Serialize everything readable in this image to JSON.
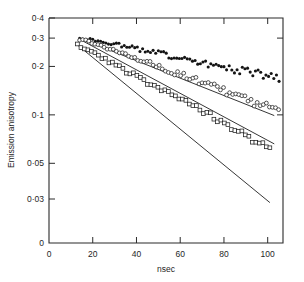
{
  "chart_data": {
    "type": "scatter",
    "title": "",
    "xlabel": "nsec",
    "ylabel": "Emission anisotropy",
    "yscale": "log",
    "xscale": "linear",
    "xlim": [
      0,
      107
    ],
    "ylim": [
      0.025,
      0.4
    ],
    "grid": false,
    "legend": "none",
    "xticks": [
      0,
      20,
      40,
      60,
      80,
      100
    ],
    "xtick_labels": [
      "0",
      "20",
      "40",
      "60",
      "80",
      "100"
    ],
    "yticks": [
      0.4,
      0.3,
      0.2,
      0.1,
      0.05,
      0.03
    ],
    "ytick_labels": [
      "0·4",
      "0·3",
      "0·2",
      "0·1",
      "0·05",
      "0·03"
    ],
    "y_origin_label": "0",
    "series": [
      {
        "name": "filled-circles",
        "marker": "filled-circle",
        "color": "#141414",
        "fit_line": {
          "x0": 14.0,
          "y0": 0.3,
          "x1": 103.0,
          "y1": 0.099
        },
        "x": [
          14.0,
          15.2,
          16.4,
          17.6,
          18.8,
          20.0,
          21.2,
          22.4,
          23.6,
          24.8,
          26.0,
          27.2,
          28.4,
          29.6,
          30.8,
          32.0,
          33.2,
          34.4,
          35.6,
          36.8,
          38.0,
          39.2,
          40.4,
          41.6,
          42.8,
          44.0,
          45.2,
          46.4,
          47.6,
          48.8,
          50.0,
          51.2,
          52.4,
          53.6,
          54.8,
          56.0,
          57.2,
          58.4,
          59.6,
          60.8,
          62.0,
          63.2,
          64.4,
          65.6,
          66.8,
          68.0,
          69.2,
          70.4,
          71.6,
          72.8,
          74.0,
          75.2,
          76.4,
          77.6,
          78.8,
          80.0,
          81.2,
          82.4,
          83.6,
          84.8,
          86.0,
          87.2,
          88.4,
          89.6,
          90.8,
          92.0,
          93.2,
          94.4,
          95.6,
          96.8,
          98.0,
          99.2,
          100.4,
          101.6,
          102.8,
          104.0,
          105.2
        ],
        "y": [
          0.301,
          0.299,
          0.297,
          0.296,
          0.293,
          0.291,
          0.289,
          0.288,
          0.285,
          0.283,
          0.281,
          0.279,
          0.277,
          0.276,
          0.273,
          0.271,
          0.269,
          0.267,
          0.265,
          0.263,
          0.261,
          0.259,
          0.257,
          0.255,
          0.253,
          0.251,
          0.249,
          0.248,
          0.246,
          0.244,
          0.242,
          0.24,
          0.238,
          0.236,
          0.234,
          0.233,
          0.231,
          0.229,
          0.227,
          0.226,
          0.224,
          0.222,
          0.22,
          0.219,
          0.217,
          0.215,
          0.213,
          0.212,
          0.21,
          0.208,
          0.207,
          0.205,
          0.203,
          0.202,
          0.2,
          0.198,
          0.197,
          0.195,
          0.194,
          0.192,
          0.191,
          0.189,
          0.188,
          0.186,
          0.185,
          0.183,
          0.182,
          0.18,
          0.179,
          0.177,
          0.176,
          0.174,
          0.173,
          0.172,
          0.17,
          0.169,
          0.167
        ]
      },
      {
        "name": "open-circles",
        "marker": "open-circle",
        "color": "#1f1f1f",
        "fit_line": {
          "x0": 14.0,
          "y0": 0.295,
          "x1": 103.0,
          "y1": 0.066
        },
        "x": [
          14.0,
          15.4,
          16.8,
          18.2,
          19.6,
          21.0,
          22.4,
          23.8,
          25.2,
          26.6,
          28.0,
          29.4,
          30.8,
          32.2,
          33.6,
          35.0,
          36.4,
          37.8,
          39.2,
          40.6,
          42.0,
          43.4,
          44.8,
          46.2,
          47.6,
          49.0,
          50.4,
          51.8,
          53.2,
          54.6,
          56.0,
          57.4,
          58.8,
          60.2,
          61.6,
          63.0,
          64.4,
          65.8,
          67.2,
          68.6,
          70.0,
          71.4,
          72.8,
          74.2,
          75.6,
          77.0,
          78.4,
          79.8,
          81.2,
          82.6,
          84.0,
          85.4,
          86.8,
          88.2,
          89.6,
          91.0,
          92.4,
          93.8,
          95.2,
          96.6,
          98.0,
          99.4,
          100.8,
          102.2,
          103.6,
          105.0
        ],
        "y": [
          0.296,
          0.292,
          0.288,
          0.284,
          0.279,
          0.275,
          0.271,
          0.267,
          0.263,
          0.259,
          0.255,
          0.251,
          0.247,
          0.243,
          0.24,
          0.236,
          0.232,
          0.229,
          0.225,
          0.222,
          0.218,
          0.215,
          0.211,
          0.208,
          0.205,
          0.202,
          0.198,
          0.195,
          0.192,
          0.189,
          0.186,
          0.183,
          0.18,
          0.177,
          0.175,
          0.172,
          0.169,
          0.166,
          0.164,
          0.161,
          0.158,
          0.156,
          0.153,
          0.151,
          0.148,
          0.146,
          0.144,
          0.141,
          0.139,
          0.137,
          0.135,
          0.132,
          0.13,
          0.128,
          0.126,
          0.124,
          0.122,
          0.12,
          0.118,
          0.117,
          0.115,
          0.113,
          0.111,
          0.109,
          0.108,
          0.106
        ]
      },
      {
        "name": "open-squares",
        "marker": "open-square",
        "color": "#1f1f1f",
        "fit_line": {
          "x0": 13.0,
          "y0": 0.272,
          "x1": 101.0,
          "y1": 0.0285
        },
        "x": [
          13.0,
          14.6,
          16.2,
          17.8,
          19.4,
          21.0,
          22.6,
          24.2,
          25.8,
          27.4,
          29.0,
          30.6,
          32.2,
          33.8,
          35.4,
          37.0,
          38.6,
          40.2,
          41.8,
          43.4,
          45.0,
          46.6,
          48.2,
          49.8,
          51.4,
          53.0,
          54.6,
          56.2,
          57.8,
          59.4,
          61.0,
          62.6,
          64.2,
          65.8,
          67.4,
          69.0,
          70.6,
          72.2,
          73.8,
          75.4,
          77.0,
          78.6,
          80.2,
          81.8,
          83.4,
          85.0,
          86.6,
          88.2,
          89.8,
          91.4,
          93.0,
          94.6,
          96.2,
          97.8,
          99.4,
          101.0
        ],
        "y": [
          0.273,
          0.266,
          0.259,
          0.252,
          0.245,
          0.239,
          0.232,
          0.226,
          0.22,
          0.214,
          0.209,
          0.203,
          0.198,
          0.192,
          0.187,
          0.182,
          0.177,
          0.173,
          0.168,
          0.164,
          0.159,
          0.155,
          0.151,
          0.147,
          0.143,
          0.139,
          0.135,
          0.132,
          0.128,
          0.125,
          0.122,
          0.118,
          0.115,
          0.112,
          0.109,
          0.106,
          0.103,
          0.101,
          0.098,
          0.095,
          0.093,
          0.09,
          0.088,
          0.086,
          0.083,
          0.081,
          0.079,
          0.077,
          0.075,
          0.073,
          0.071,
          0.069,
          0.067,
          0.065,
          0.064,
          0.062
        ]
      }
    ]
  },
  "axes": {
    "ylabel": "Emission anisotropy",
    "xlabel": "nsec"
  }
}
